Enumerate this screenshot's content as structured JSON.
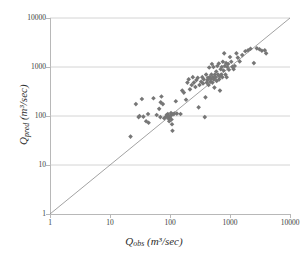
{
  "chart_data": {
    "type": "scatter",
    "title": "",
    "xlabel": "Qobs (m³/sec)",
    "ylabel": "Qpred (m³/sec)",
    "xlabel_base": "Q",
    "xlabel_sub": "obs",
    "xlabel_unit": " (m³/sec)",
    "ylabel_base": "Q",
    "ylabel_sub": "pred",
    "ylabel_unit": " (m³/sec)",
    "xscale": "log",
    "yscale": "log",
    "xlim": [
      1,
      10000
    ],
    "ylim": [
      1,
      10000
    ],
    "xticks": [
      "1",
      "10",
      "100",
      "1000",
      "10000"
    ],
    "yticks": [
      "1",
      "10",
      "100",
      "1000",
      "10000"
    ],
    "xtick_values": [
      1,
      10,
      100,
      1000,
      10000
    ],
    "ytick_values": [
      1,
      10,
      100,
      1000,
      10000
    ],
    "grid": "horizontal",
    "legend": "none",
    "marker": "diamond",
    "marker_color": "#767676",
    "gridline_color": "#c9c9c9",
    "axis_color": "#b8b8b8",
    "reference_line": {
      "name": "1:1 line",
      "from": [
        1,
        1
      ],
      "to": [
        10000,
        10000
      ],
      "color": "#8a8a8a"
    },
    "points": [
      [
        22,
        38
      ],
      [
        27,
        175
      ],
      [
        30,
        95
      ],
      [
        31,
        100
      ],
      [
        34,
        223
      ],
      [
        36,
        97
      ],
      [
        40,
        78
      ],
      [
        43,
        110
      ],
      [
        44,
        73
      ],
      [
        53,
        230
      ],
      [
        60,
        105
      ],
      [
        66,
        140
      ],
      [
        69,
        95
      ],
      [
        70,
        190
      ],
      [
        72,
        250
      ],
      [
        76,
        175
      ],
      [
        80,
        90
      ],
      [
        86,
        97
      ],
      [
        88,
        105
      ],
      [
        90,
        100
      ],
      [
        92,
        110
      ],
      [
        95,
        88
      ],
      [
        97,
        78
      ],
      [
        100,
        95
      ],
      [
        102,
        102
      ],
      [
        104,
        115
      ],
      [
        106,
        85
      ],
      [
        108,
        68
      ],
      [
        110,
        50
      ],
      [
        112,
        108
      ],
      [
        118,
        112
      ],
      [
        125,
        200
      ],
      [
        130,
        112
      ],
      [
        150,
        110
      ],
      [
        160,
        330
      ],
      [
        170,
        300
      ],
      [
        185,
        215
      ],
      [
        195,
        480
      ],
      [
        205,
        560
      ],
      [
        215,
        350
      ],
      [
        230,
        430
      ],
      [
        240,
        620
      ],
      [
        250,
        480
      ],
      [
        265,
        390
      ],
      [
        275,
        540
      ],
      [
        290,
        600
      ],
      [
        300,
        150
      ],
      [
        310,
        430
      ],
      [
        330,
        500
      ],
      [
        345,
        620
      ],
      [
        355,
        460
      ],
      [
        365,
        560
      ],
      [
        380,
        95
      ],
      [
        390,
        240
      ],
      [
        400,
        700
      ],
      [
        410,
        480
      ],
      [
        420,
        540
      ],
      [
        430,
        600
      ],
      [
        440,
        430
      ],
      [
        450,
        980
      ],
      [
        460,
        620
      ],
      [
        470,
        500
      ],
      [
        480,
        560
      ],
      [
        490,
        700
      ],
      [
        500,
        1150
      ],
      [
        510,
        480
      ],
      [
        520,
        620
      ],
      [
        530,
        1000
      ],
      [
        540,
        560
      ],
      [
        550,
        380
      ],
      [
        560,
        700
      ],
      [
        575,
        620
      ],
      [
        590,
        810
      ],
      [
        600,
        520
      ],
      [
        615,
        1050
      ],
      [
        630,
        700
      ],
      [
        650,
        1180
      ],
      [
        660,
        560
      ],
      [
        670,
        640
      ],
      [
        680,
        330
      ],
      [
        700,
        900
      ],
      [
        715,
        700
      ],
      [
        730,
        1000
      ],
      [
        745,
        620
      ],
      [
        760,
        1280
      ],
      [
        780,
        850
      ],
      [
        800,
        1900
      ],
      [
        820,
        1050
      ],
      [
        840,
        700
      ],
      [
        860,
        1200
      ],
      [
        880,
        620
      ],
      [
        900,
        1000
      ],
      [
        930,
        1150
      ],
      [
        960,
        880
      ],
      [
        1000,
        1600
      ],
      [
        1050,
        1280
      ],
      [
        1100,
        1000
      ],
      [
        1150,
        900
      ],
      [
        1200,
        1050
      ],
      [
        1280,
        1900
      ],
      [
        1350,
        1550
      ],
      [
        1450,
        1300
      ],
      [
        1600,
        1750
      ],
      [
        1800,
        2100
      ],
      [
        2000,
        2200
      ],
      [
        2200,
        2350
      ],
      [
        2500,
        1200
      ],
      [
        2800,
        2400
      ],
      [
        3100,
        2300
      ],
      [
        3400,
        2150
      ],
      [
        3800,
        2200
      ],
      [
        4000,
        1900
      ]
    ]
  }
}
